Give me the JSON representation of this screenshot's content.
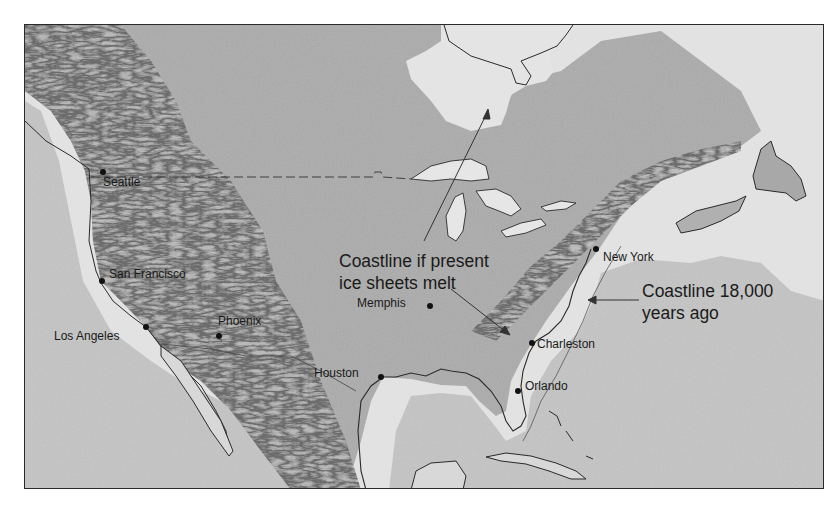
{
  "map": {
    "title": "",
    "style": "grayscale shaded relief",
    "colors": {
      "ocean": "#c4c4c4",
      "land_low": "#dcdcdc",
      "land_interior": "#a9a9a9",
      "mountains": "#b4b4b4",
      "coastline": "#2a2a2a",
      "border": "#2a2a2a",
      "text": "#1a1a1a"
    },
    "annotations": {
      "future_coastline": {
        "line1": "Coastline if present",
        "line2": "ice sheets melt"
      },
      "ancient_coastline": {
        "line1": "Coastline 18,000",
        "line2": "years ago"
      }
    },
    "cities": [
      {
        "name": "Seattle",
        "x": 102,
        "y": 171
      },
      {
        "name": "San Francisco",
        "x": 101,
        "y": 280
      },
      {
        "name": "Los Angeles",
        "x": 145,
        "y": 326
      },
      {
        "name": "Phoenix",
        "x": 218,
        "y": 335
      },
      {
        "name": "Houston",
        "x": 380,
        "y": 376
      },
      {
        "name": "Memphis",
        "x": 429,
        "y": 305
      },
      {
        "name": "New York",
        "x": 595,
        "y": 248
      },
      {
        "name": "Charleston",
        "x": 531,
        "y": 342
      },
      {
        "name": "Orlando",
        "x": 517,
        "y": 390
      }
    ]
  }
}
